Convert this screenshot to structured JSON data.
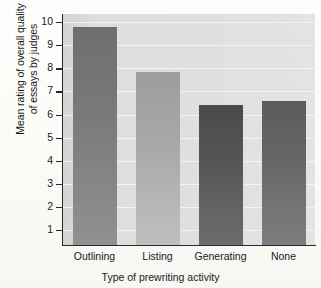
{
  "chart_data": {
    "type": "bar",
    "title": "",
    "categories": [
      "Outlining",
      "Listing",
      "Generating",
      "None"
    ],
    "values": [
      9.8,
      7.85,
      6.4,
      6.6
    ],
    "series": [
      {
        "name": "Mean rating of overall quality of essays by judges",
        "values": [
          9.8,
          7.85,
          6.4,
          6.6
        ]
      }
    ],
    "xlabel": "Type of prewriting activity",
    "ylabel_lines": [
      "Mean rating of overall quality",
      "of essays by judges"
    ],
    "ylabel": "Mean rating of overall quality of essays by judges",
    "ylim": [
      0.35,
      10.35
    ],
    "yticks": [
      10,
      9,
      8,
      7,
      6,
      5,
      4,
      3,
      2,
      1
    ],
    "ytick_labels": [
      "10",
      "9",
      "8",
      "7",
      "6",
      "5",
      "4",
      "3",
      "2",
      "1"
    ],
    "grid": true,
    "grid_axis": "y",
    "legend": false,
    "legend_position": "none",
    "bar_colors": [
      "#6f6f6f",
      "#9d9d9d",
      "#4b4b4b",
      "#5c5c5c"
    ],
    "plot_background": "#dddddd",
    "gridline_color": "#f4f4f4",
    "axis_color": "#2a2a2a",
    "page_background": "#fdfdfb"
  },
  "axes": {
    "y_title_line1": "Mean rating of overall quality",
    "y_title_line2": "of essays by judges",
    "x_title": "Type of prewriting activity"
  },
  "ticks": {
    "y": [
      "10",
      "9",
      "8",
      "7",
      "6",
      "5",
      "4",
      "3",
      "2",
      "1"
    ]
  },
  "categories": {
    "c0": "Outlining",
    "c1": "Listing",
    "c2": "Generating",
    "c3": "None"
  }
}
